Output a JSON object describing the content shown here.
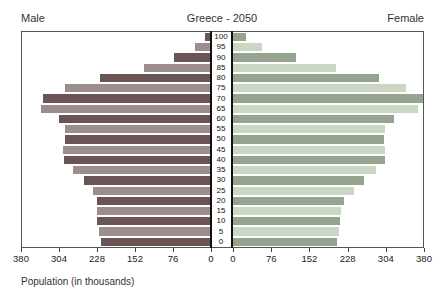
{
  "header": {
    "left": "Male",
    "title": "Greece - 2050",
    "right": "Female"
  },
  "footer": {
    "caption": "Population (in thousands)"
  },
  "chart_data": {
    "type": "bar",
    "subtype": "population-pyramid",
    "title": "Greece - 2050",
    "unit": "thousands",
    "xlabel": "Population (in thousands)",
    "axis": {
      "max": 380,
      "ticks": [
        0,
        76,
        152,
        228,
        304,
        380
      ]
    },
    "ages_top_to_bottom": [
      100,
      95,
      90,
      85,
      80,
      75,
      70,
      65,
      60,
      55,
      50,
      45,
      40,
      35,
      30,
      25,
      20,
      15,
      10,
      5,
      0
    ],
    "series": [
      {
        "name": "Male",
        "side": "left",
        "values_top_to_bottom": [
          10,
          30,
          72,
          134,
          223,
          293,
          337,
          341,
          306,
          293,
          294,
          297,
          295,
          277,
          255,
          237,
          229,
          229,
          229,
          225,
          221
        ]
      },
      {
        "name": "Female",
        "side": "right",
        "values_top_to_bottom": [
          26,
          58,
          127,
          206,
          292,
          345,
          380,
          370,
          322,
          304,
          302,
          304,
          304,
          286,
          262,
          242,
          222,
          216,
          214,
          212,
          208
        ]
      }
    ],
    "colors": {
      "male_dark": "#6b5454",
      "male_light": "#9e8d8d",
      "female_dark": "#95a38f",
      "female_light": "#cbd7c5",
      "axis_line": "#555",
      "zero_line": "#111",
      "text": "#333"
    },
    "legend_position": "none",
    "grid": false
  }
}
